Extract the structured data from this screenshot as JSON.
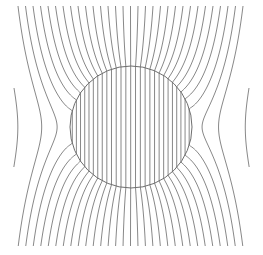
{
  "figure": {
    "title": "",
    "background": "#ffffff",
    "line_color": "#7a7a7a",
    "circle_color": "#6e6e6e"
  },
  "diagram": {
    "width": 263,
    "height": 255,
    "circle": {
      "cx": 131,
      "cy": 127,
      "r": 61
    },
    "field_lines": {
      "count": 31,
      "far_spacing": 7.5,
      "x_start": 18,
      "y_top": 6,
      "y_bottom": 246,
      "permittivity_ratio": 19
    }
  }
}
